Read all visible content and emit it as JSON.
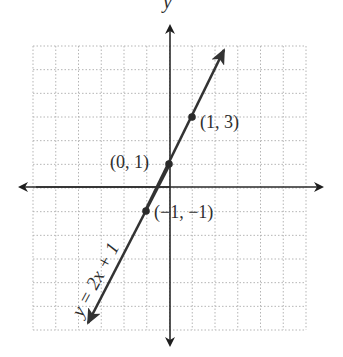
{
  "figure": {
    "axes": {
      "x_label": "x",
      "y_label": "y",
      "x_range": [
        -6,
        6
      ],
      "y_range": [
        -6,
        6
      ],
      "grid": "dotted"
    },
    "line": {
      "equation_label": "y = 2x + 1",
      "slope": 2,
      "intercept": 1,
      "color": "#333333"
    },
    "points": [
      {
        "label": "(1, 3)",
        "x": 1,
        "y": 3
      },
      {
        "label": "(0, 1)",
        "x": 0,
        "y": 1
      },
      {
        "label": "(−1, −1)",
        "x": -1,
        "y": -1
      }
    ]
  },
  "chart_data": {
    "type": "line",
    "title": "",
    "xlabel": "x",
    "ylabel": "y",
    "xlim": [
      -6,
      6
    ],
    "ylim": [
      -6,
      6
    ],
    "grid": true,
    "series": [
      {
        "name": "y = 2x + 1",
        "x": [
          -3.5,
          -1,
          0,
          1,
          2.3
        ],
        "values": [
          -6,
          -1,
          1,
          3,
          5.6
        ]
      }
    ],
    "annotations": [
      {
        "text": "(1, 3)",
        "x": 1,
        "y": 3
      },
      {
        "text": "(0, 1)",
        "x": 0,
        "y": 1
      },
      {
        "text": "(−1, −1)",
        "x": -1,
        "y": -1
      },
      {
        "text": "y = 2x + 1",
        "position": "along line, lower-left"
      }
    ]
  }
}
